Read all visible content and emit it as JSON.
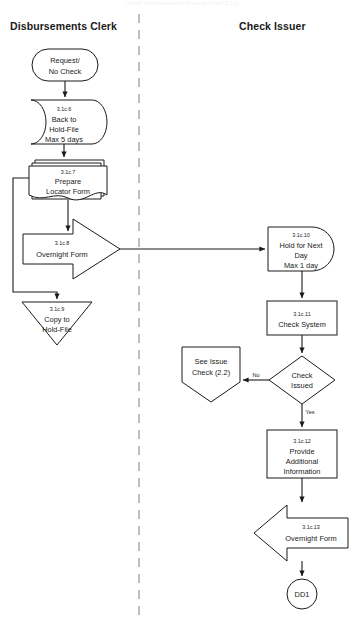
{
  "document": {
    "title": "Check Disbursements Process Flow (3.1c)",
    "width": 363,
    "height": 630,
    "background": "#ffffff",
    "line_color": "#1a1a1a",
    "divider_color": "#8a8a8a"
  },
  "lanes": [
    {
      "id": "lane-left",
      "label": "Disbursements Clerk",
      "x": 10,
      "y": 20
    },
    {
      "id": "lane-right",
      "label": "Check Issuer",
      "x": 239,
      "y": 20
    }
  ],
  "divider": {
    "x": 139,
    "y1": 14,
    "y2": 616,
    "style": "dashed"
  },
  "nodes": [
    {
      "id": "n-start",
      "shape": "terminator",
      "lane": "left",
      "number": "",
      "lines": [
        "Request/",
        "No Check"
      ],
      "cx": 65,
      "cy": 65,
      "w": 68,
      "h": 32
    },
    {
      "id": "n-3-1c-6",
      "shape": "stored-data",
      "lane": "left",
      "number": "3.1c.6",
      "lines": [
        "Back to",
        "Hold-File",
        "Max 5 days"
      ],
      "cx": 65,
      "cy": 122,
      "w": 72,
      "h": 44
    },
    {
      "id": "n-3-1c-7",
      "shape": "multidocument",
      "lane": "left",
      "number": "3.1c.7",
      "lines": [
        "Prepare",
        "Locator Form"
      ],
      "cx": 68,
      "cy": 179,
      "w": 76,
      "h": 40
    },
    {
      "id": "n-3-1c-8",
      "shape": "arrow-right",
      "lane": "left",
      "number": "3.1c.8",
      "lines": [
        "Overnight Form"
      ],
      "cx": 72,
      "cy": 248,
      "w": 98,
      "h": 58
    },
    {
      "id": "n-3-1c-9",
      "shape": "triangle-down",
      "lane": "left",
      "number": "3.1c.9",
      "lines": [
        "Copy to",
        "Hold-File"
      ],
      "cx": 57,
      "cy": 321,
      "w": 70,
      "h": 48
    },
    {
      "id": "n-3-1c-10",
      "shape": "delay",
      "lane": "right",
      "number": "3.1c.10",
      "lines": [
        "Hold for Next",
        "Day",
        "Max 1 day"
      ],
      "cx": 302,
      "cy": 248,
      "w": 72,
      "h": 44
    },
    {
      "id": "n-3-1c-11",
      "shape": "process",
      "lane": "right",
      "number": "3.1c.11",
      "lines": [
        "Check System"
      ],
      "cx": 302,
      "cy": 318,
      "w": 70,
      "h": 34
    },
    {
      "id": "n-decision",
      "shape": "decision",
      "lane": "right",
      "number": "",
      "lines": [
        "Check",
        "Issued"
      ],
      "cx": 302,
      "cy": 380,
      "w": 66,
      "h": 48
    },
    {
      "id": "n-offpage",
      "shape": "pentagon-down",
      "lane": "right",
      "number": "",
      "lines": [
        "See Issue",
        "Check (2.2)"
      ],
      "cx": 211,
      "cy": 372,
      "w": 60,
      "h": 52
    },
    {
      "id": "n-3-1c-12",
      "shape": "process",
      "lane": "right",
      "number": "3.1c.12",
      "lines": [
        "Provide",
        "Additional",
        "Information"
      ],
      "cx": 302,
      "cy": 454,
      "w": 70,
      "h": 48
    },
    {
      "id": "n-3-1c-13",
      "shape": "arrow-left",
      "lane": "right",
      "number": "3.1c.13",
      "lines": [
        "Overnight Form"
      ],
      "cx": 300,
      "cy": 531,
      "w": 96,
      "h": 52
    },
    {
      "id": "n-dd1",
      "shape": "connector-circle",
      "lane": "right",
      "number": "",
      "lines": [
        "DD1"
      ],
      "cx": 302,
      "cy": 594,
      "w": 30,
      "h": 30
    }
  ],
  "edges": [
    {
      "id": "e-start-6",
      "from": "n-start",
      "to": "n-3-1c-6",
      "label": "",
      "arrow": true
    },
    {
      "id": "e-6-7",
      "from": "n-3-1c-6",
      "to": "n-3-1c-7",
      "label": "",
      "arrow": true
    },
    {
      "id": "e-7-8",
      "from": "n-3-1c-7",
      "to": "n-3-1c-8",
      "label": "",
      "arrow": true
    },
    {
      "id": "e-7-9-loop",
      "from": "n-3-1c-7",
      "to": "n-3-1c-9",
      "label": "",
      "arrow": true
    },
    {
      "id": "e-8-10",
      "from": "n-3-1c-8",
      "to": "n-3-1c-10",
      "label": "",
      "arrow": true
    },
    {
      "id": "e-10-11",
      "from": "n-3-1c-10",
      "to": "n-3-1c-11",
      "label": "",
      "arrow": true
    },
    {
      "id": "e-11-dec",
      "from": "n-3-1c-11",
      "to": "n-decision",
      "label": "",
      "arrow": true
    },
    {
      "id": "e-dec-no",
      "from": "n-decision",
      "to": "n-offpage",
      "label": "No",
      "arrow": true
    },
    {
      "id": "e-dec-yes",
      "from": "n-decision",
      "to": "n-3-1c-12",
      "label": "Yes",
      "arrow": true
    },
    {
      "id": "e-12-13",
      "from": "n-3-1c-12",
      "to": "n-3-1c-13",
      "label": "",
      "arrow": true
    },
    {
      "id": "e-13-dd1",
      "from": "n-3-1c-13",
      "to": "n-dd1",
      "label": "",
      "arrow": true
    }
  ],
  "edge_labels": {
    "no": "No",
    "yes": "Yes"
  }
}
